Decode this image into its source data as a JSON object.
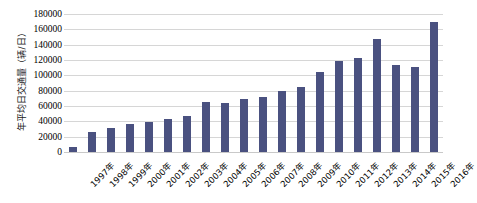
{
  "chart_data": {
    "type": "bar",
    "title": "",
    "xlabel": "",
    "ylabel": "年平均日交通量（辆/日）",
    "ylim": [
      0,
      180000
    ],
    "ytick_step": 20000,
    "yticks": [
      0,
      20000,
      40000,
      60000,
      80000,
      100000,
      120000,
      140000,
      160000,
      180000
    ],
    "ytick_labels": [
      "0",
      "20000",
      "40000",
      "60000",
      "80000",
      "100000",
      "120000",
      "140000",
      "160000",
      "180000"
    ],
    "grid": true,
    "legend": false,
    "categories": [
      "1997年",
      "1998年",
      "1999年",
      "2000年",
      "2001年",
      "2002年",
      "2003年",
      "2004年",
      "2005年",
      "2006年",
      "2007年",
      "2008年",
      "2009年",
      "2010年",
      "2011年",
      "2012年",
      "2013年",
      "2014年",
      "2015年",
      "2016年"
    ],
    "values": [
      7000,
      26000,
      31000,
      36000,
      39000,
      43000,
      47000,
      65000,
      64500,
      69500,
      72000,
      79000,
      85000,
      104000,
      119000,
      122000,
      148000,
      114000,
      111000,
      170000
    ],
    "series": [
      {
        "name": "年平均日交通量",
        "values": [
          7000,
          26000,
          31000,
          36000,
          39000,
          43000,
          47000,
          65000,
          64500,
          69500,
          72000,
          79000,
          85000,
          104000,
          119000,
          122000,
          148000,
          114000,
          111000,
          170000
        ]
      }
    ],
    "bar_color": "#4a5180",
    "grid_color": "#d6d6d6",
    "background_color": "#ffffff"
  }
}
